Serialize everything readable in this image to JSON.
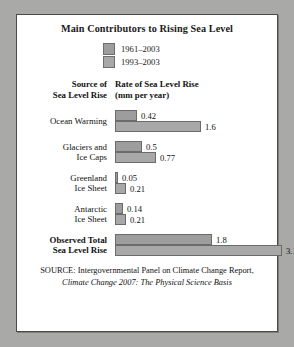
{
  "chart_data": {
    "type": "bar",
    "title": "Main Contributors to Rising Sea Level",
    "orientation": "horizontal",
    "xlabel": "Rate of Sea Level Rise (mm per year)",
    "ylabel": "Source of Sea Level Rise",
    "grid": false,
    "legend_position": "top",
    "xlim": [
      0,
      3.1
    ],
    "categories": [
      "Ocean Warming",
      "Glaciers and Ice Caps",
      "Greenland Ice Sheet",
      "Antarctic Ice Sheet",
      "Observed Total Sea Level Rise"
    ],
    "series": [
      {
        "name": "1961–2003",
        "values": [
          0.42,
          0.5,
          0.05,
          0.14,
          1.8
        ]
      },
      {
        "name": "1993–2003",
        "values": [
          1.6,
          0.77,
          0.21,
          0.21,
          3.1
        ]
      }
    ]
  },
  "header": {
    "col_source_line1": "Source of",
    "col_source_line2": "Sea Level Rise",
    "col_rate_line1": "Rate of Sea Level Rise",
    "col_rate_line2": "(mm per year)"
  },
  "legend": {
    "items": [
      {
        "label": "1961–2003",
        "color": "#9d9d9d"
      },
      {
        "label": "1993–2003",
        "color": "#a8a8a8"
      }
    ]
  },
  "rows": [
    {
      "label_line1": "Ocean Warming",
      "label_line2": "",
      "v1": "0.42",
      "v2": "1.6",
      "w1": "22",
      "w2": "86"
    },
    {
      "label_line1": "Glaciers and",
      "label_line2": "Ice Caps",
      "v1": "0.5",
      "v2": "0.77",
      "w1": "27",
      "w2": "41"
    },
    {
      "label_line1": "Greenland",
      "label_line2": "Ice Sheet",
      "v1": "0.05",
      "v2": "0.21",
      "w1": "3",
      "w2": "11"
    },
    {
      "label_line1": "Antarctic",
      "label_line2": "Ice Sheet",
      "v1": "0.14",
      "v2": "0.21",
      "w1": "8",
      "w2": "11"
    },
    {
      "label_line1": "Observed Total",
      "label_line2": "Sea Level Rise",
      "v1": "1.8",
      "v2": "3.1",
      "w1": "97",
      "w2": "167"
    }
  ],
  "source": {
    "line1": "SOURCE: Intergovernmental Panel on Climate Change Report,",
    "line2": "Climate Change 2007: The Physical Science Basis"
  }
}
